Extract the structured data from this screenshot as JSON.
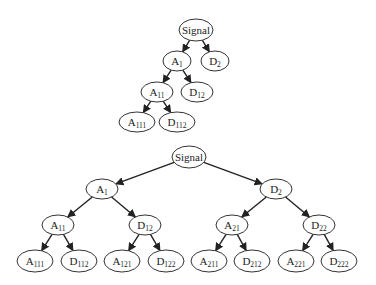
{
  "diagram": {
    "type": "wavelet-decomposition-trees",
    "trees": [
      {
        "name": "wavelet-decomposition-tree",
        "nodes": [
          {
            "id": "signal",
            "base": "Signal",
            "sub": "",
            "x": 196,
            "y": 30,
            "rx": 17,
            "ry": 11
          },
          {
            "id": "a1",
            "base": "A",
            "sub": "1",
            "x": 177,
            "y": 61,
            "rx": 14,
            "ry": 10
          },
          {
            "id": "d2",
            "base": "D",
            "sub": "2",
            "x": 215,
            "y": 61,
            "rx": 14,
            "ry": 10
          },
          {
            "id": "a11",
            "base": "A",
            "sub": "11",
            "x": 157,
            "y": 92,
            "rx": 16,
            "ry": 10
          },
          {
            "id": "d12",
            "base": "D",
            "sub": "12",
            "x": 197,
            "y": 92,
            "rx": 16,
            "ry": 10
          },
          {
            "id": "a111",
            "base": "A",
            "sub": "111",
            "x": 137,
            "y": 122,
            "rx": 18,
            "ry": 10
          },
          {
            "id": "d112",
            "base": "D",
            "sub": "112",
            "x": 177,
            "y": 122,
            "rx": 18,
            "ry": 10
          }
        ],
        "edges": [
          [
            "signal",
            "a1"
          ],
          [
            "signal",
            "d2"
          ],
          [
            "a1",
            "a11"
          ],
          [
            "a1",
            "d12"
          ],
          [
            "a11",
            "a111"
          ],
          [
            "a11",
            "d112"
          ]
        ]
      },
      {
        "name": "wavelet-packet-tree",
        "nodes": [
          {
            "id": "signal",
            "base": "Signal",
            "sub": "",
            "x": 189,
            "y": 157,
            "rx": 17,
            "ry": 11
          },
          {
            "id": "a1",
            "base": "A",
            "sub": "1",
            "x": 102,
            "y": 189,
            "rx": 16,
            "ry": 10
          },
          {
            "id": "d2",
            "base": "D",
            "sub": "2",
            "x": 276,
            "y": 189,
            "rx": 16,
            "ry": 10
          },
          {
            "id": "a11",
            "base": "A",
            "sub": "11",
            "x": 58,
            "y": 225,
            "rx": 16,
            "ry": 10
          },
          {
            "id": "d12",
            "base": "D",
            "sub": "12",
            "x": 145,
            "y": 225,
            "rx": 16,
            "ry": 10
          },
          {
            "id": "a21",
            "base": "A",
            "sub": "21",
            "x": 232,
            "y": 225,
            "rx": 16,
            "ry": 10
          },
          {
            "id": "d22",
            "base": "D",
            "sub": "22",
            "x": 319,
            "y": 225,
            "rx": 16,
            "ry": 10
          },
          {
            "id": "a111",
            "base": "A",
            "sub": "111",
            "x": 35,
            "y": 261,
            "rx": 18,
            "ry": 11
          },
          {
            "id": "d112",
            "base": "D",
            "sub": "112",
            "x": 79,
            "y": 261,
            "rx": 18,
            "ry": 11
          },
          {
            "id": "a121",
            "base": "A",
            "sub": "121",
            "x": 122,
            "y": 261,
            "rx": 18,
            "ry": 11
          },
          {
            "id": "d122",
            "base": "D",
            "sub": "122",
            "x": 166,
            "y": 261,
            "rx": 18,
            "ry": 11
          },
          {
            "id": "a211",
            "base": "A",
            "sub": "211",
            "x": 209,
            "y": 261,
            "rx": 18,
            "ry": 11
          },
          {
            "id": "d212",
            "base": "D",
            "sub": "212",
            "x": 252,
            "y": 261,
            "rx": 18,
            "ry": 11
          },
          {
            "id": "a221",
            "base": "A",
            "sub": "221",
            "x": 296,
            "y": 261,
            "rx": 18,
            "ry": 11
          },
          {
            "id": "d222",
            "base": "D",
            "sub": "222",
            "x": 339,
            "y": 261,
            "rx": 18,
            "ry": 11
          }
        ],
        "edges": [
          [
            "signal",
            "a1"
          ],
          [
            "signal",
            "d2"
          ],
          [
            "a1",
            "a11"
          ],
          [
            "a1",
            "d12"
          ],
          [
            "d2",
            "a21"
          ],
          [
            "d2",
            "d22"
          ],
          [
            "a11",
            "a111"
          ],
          [
            "a11",
            "d112"
          ],
          [
            "d12",
            "a121"
          ],
          [
            "d12",
            "d122"
          ],
          [
            "a21",
            "a211"
          ],
          [
            "a21",
            "d212"
          ],
          [
            "d22",
            "a221"
          ],
          [
            "d22",
            "d222"
          ]
        ]
      }
    ]
  }
}
